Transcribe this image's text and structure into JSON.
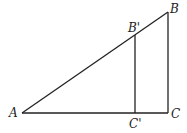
{
  "diagram": {
    "type": "similar right triangles",
    "points": {
      "A": {
        "label": "A",
        "x": 22,
        "y": 113
      },
      "B": {
        "label": "B",
        "x": 168,
        "y": 12
      },
      "C": {
        "label": "C",
        "x": 168,
        "y": 113
      },
      "B_prime": {
        "label": "B'",
        "x": 135,
        "y": 35
      },
      "C_prime": {
        "label": "C'",
        "x": 135,
        "y": 113
      }
    },
    "segments": [
      "AB",
      "AC",
      "BC",
      "B'C'"
    ]
  }
}
